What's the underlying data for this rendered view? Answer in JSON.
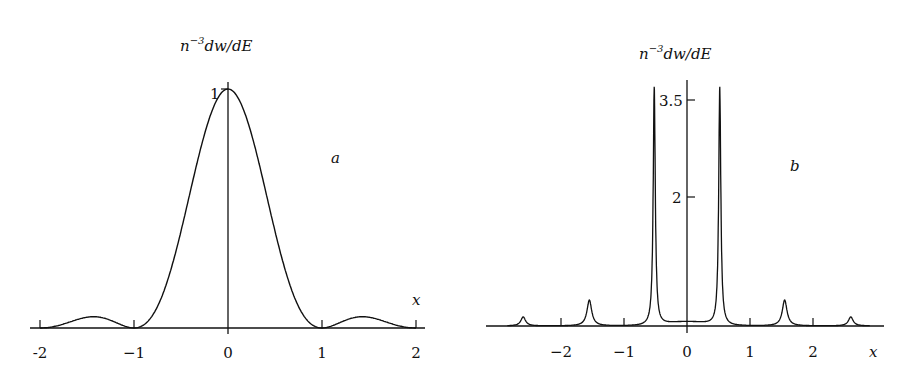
{
  "chart_data": [
    {
      "panel": "a",
      "type": "line",
      "title": "",
      "ylabel": "n^{-3} dw/dE",
      "ylabel_parts": {
        "base": "n",
        "sup": "−3",
        "rest": "dw/dE"
      },
      "xlabel": "x",
      "panel_label": "a",
      "x_ticks": [
        "-2",
        "−1",
        "0",
        "1",
        "2"
      ],
      "x_tick_values": [
        -2,
        -1,
        0,
        1,
        2
      ],
      "y_ticks": [
        "1"
      ],
      "y_tick_values": [
        1
      ],
      "xlim": [
        -2.05,
        2.05
      ],
      "ylim": [
        0,
        1.05
      ],
      "grid": false,
      "description": "Central peak of height 1 at x=0, zeros at x=±1 and ±2, small side lobes (~0.045) near x=±1.45",
      "x": [
        -2.0,
        -1.8,
        -1.6,
        -1.45,
        -1.3,
        -1.1,
        -1.0,
        -0.9,
        -0.8,
        -0.6,
        -0.4,
        -0.2,
        0.0,
        0.2,
        0.4,
        0.6,
        0.8,
        0.9,
        1.0,
        1.1,
        1.3,
        1.45,
        1.6,
        1.8,
        2.0
      ],
      "values": [
        0.0,
        0.016,
        0.038,
        0.047,
        0.039,
        0.008,
        0.0,
        0.012,
        0.055,
        0.255,
        0.573,
        0.875,
        1.0,
        0.875,
        0.573,
        0.255,
        0.055,
        0.012,
        0.0,
        0.008,
        0.039,
        0.047,
        0.038,
        0.016,
        0.0
      ]
    },
    {
      "panel": "b",
      "type": "line",
      "title": "",
      "ylabel": "n^{-3} dw/dE",
      "ylabel_parts": {
        "base": "n",
        "sup": "−3",
        "rest": "dw/dE"
      },
      "xlabel": "x",
      "panel_label": "b",
      "x_ticks": [
        "−2",
        "−1",
        "0",
        "1",
        "2"
      ],
      "x_tick_values": [
        -2,
        -1,
        0,
        1,
        2
      ],
      "y_ticks": [
        "2",
        "3.5"
      ],
      "y_tick_values": [
        2,
        3.5
      ],
      "xlim": [
        -2.9,
        3.0
      ],
      "ylim": [
        0,
        3.8
      ],
      "grid": false,
      "description": "Sharp resonance peaks: two tall (~3.7) at x=±0.52, medium (~0.4) at x≈±1.55, small (~0.14) at x≈±2.6; trough ~0.11 at x=0",
      "peaks": [
        {
          "x": -2.6,
          "y": 0.14
        },
        {
          "x": -1.55,
          "y": 0.4
        },
        {
          "x": -0.52,
          "y": 3.7
        },
        {
          "x": 0.52,
          "y": 3.7
        },
        {
          "x": 1.55,
          "y": 0.4
        },
        {
          "x": 2.6,
          "y": 0.14
        }
      ],
      "center_minimum": {
        "x": 0,
        "y": 0.11
      }
    }
  ]
}
